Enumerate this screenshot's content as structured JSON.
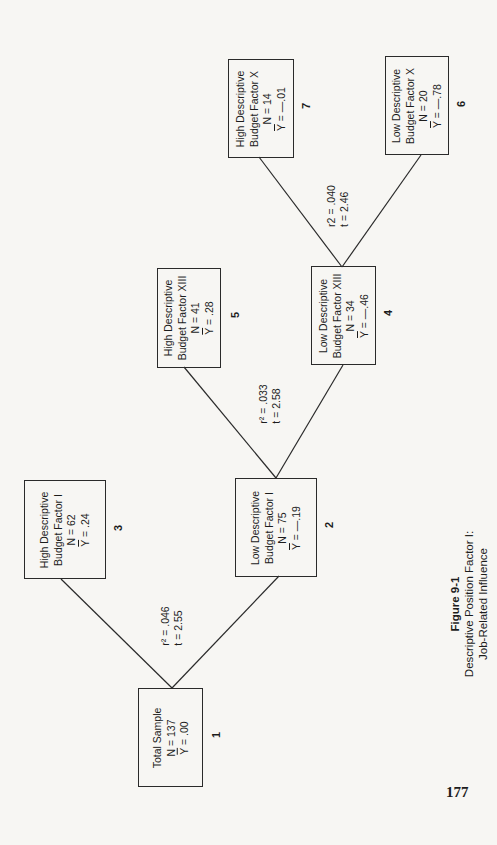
{
  "figure": {
    "label": "Figure 9-1",
    "title_line1": "Descriptive Position Factor I:",
    "title_line2": "Job-Related Influence"
  },
  "page_number": "177",
  "nodes": {
    "n1": {
      "number": "1",
      "line1": "Total Sample",
      "line2": "",
      "n": "N = 137",
      "y_label": "Y",
      "y_value": " = .00"
    },
    "n2": {
      "number": "2",
      "line1": "Low Descriptive",
      "line2": "Budget Factor I",
      "n": "N = 75",
      "y_label": "Y",
      "y_value": " = —.19"
    },
    "n3": {
      "number": "3",
      "line1": "High Descriptive",
      "line2": "Budget Factor I",
      "n": "N = 62",
      "y_label": "Y",
      "y_value": " = .24"
    },
    "n4": {
      "number": "4",
      "line1": "Low Descriptive",
      "line2": "Budget Factor XIII",
      "n": "N = 34",
      "y_label": "Y",
      "y_value": " = —.46"
    },
    "n5": {
      "number": "5",
      "line1": "High Descriptive",
      "line2": "Budget Factor XIII",
      "n": "N = 41",
      "y_label": "Y",
      "y_value": " = .28"
    },
    "n6": {
      "number": "6",
      "line1": "Low Descriptive",
      "line2": "Budget Factor X",
      "n": "N = 20",
      "y_label": "Y",
      "y_value": " = —.78"
    },
    "n7": {
      "number": "7",
      "line1": "High Descriptive",
      "line2": "Budget Factor X",
      "n": "N = 14",
      "y_label": "Y",
      "y_value": " = —.01"
    }
  },
  "splits": {
    "s1": {
      "r2": "r² = .046",
      "t": "t = 2.55"
    },
    "s2": {
      "r2": "r² = .033",
      "t": "t = 2.58"
    },
    "s4": {
      "r2": "r2 = .040",
      "t": "t = 2.46"
    }
  },
  "edges": [
    {
      "from": "1",
      "to": "3"
    },
    {
      "from": "1",
      "to": "2"
    },
    {
      "from": "2",
      "to": "5"
    },
    {
      "from": "2",
      "to": "4"
    },
    {
      "from": "4",
      "to": "7"
    },
    {
      "from": "4",
      "to": "6"
    }
  ]
}
